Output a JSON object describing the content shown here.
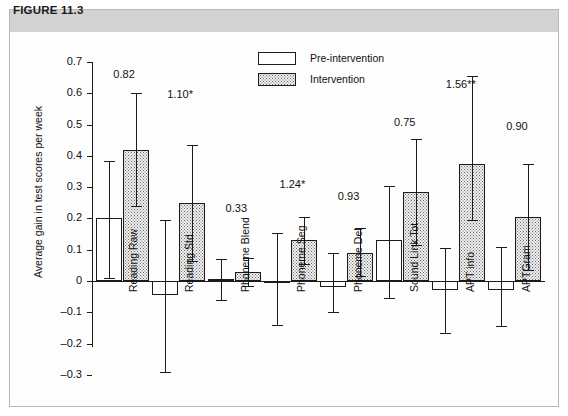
{
  "figure": {
    "header_label": "FIGURE 11.3"
  },
  "legend": {
    "position": "top-center",
    "entries": [
      {
        "label": "Pre-intervention",
        "swatch": "white-box",
        "icon": "legend-swatch-pre-icon"
      },
      {
        "label": "Intervention",
        "swatch": "dotted-box",
        "icon": "legend-swatch-post-icon"
      }
    ]
  },
  "chart_data": {
    "type": "bar",
    "title": "FIGURE 11.3",
    "xlabel": "",
    "ylabel": "Average gain in test scores per week",
    "ylim": [
      -0.3,
      0.7
    ],
    "ytick_labels": [
      "0.7",
      "0.6",
      "0.5",
      "0.4",
      "0.3",
      "0.2",
      "0.1",
      "0",
      "–0.1",
      "–0.2",
      "–0.3"
    ],
    "yticks": [
      0.7,
      0.6,
      0.5,
      0.4,
      0.3,
      0.2,
      0.1,
      0,
      -0.1,
      -0.2,
      -0.3
    ],
    "grid": false,
    "categories": [
      "Reading Raw",
      "Reading Std",
      "Phoneme Blend",
      "Phoneme Seg",
      "Phoneme Del",
      "Sound Link Tot",
      "APT info",
      "APTGram"
    ],
    "series": [
      {
        "name": "Pre-intervention",
        "values": [
          0.2,
          -0.045,
          0.005,
          0.0,
          -0.02,
          0.13,
          -0.03,
          -0.03
        ],
        "err_low": [
          0.01,
          -0.29,
          -0.06,
          -0.14,
          -0.1,
          -0.055,
          -0.165,
          -0.145
        ],
        "err_high": [
          0.385,
          0.195,
          0.07,
          0.155,
          0.09,
          0.305,
          0.105,
          0.11
        ]
      },
      {
        "name": "Intervention",
        "values": [
          0.42,
          0.25,
          0.03,
          0.13,
          0.09,
          0.285,
          0.375,
          0.205
        ],
        "err_low": [
          0.24,
          0.065,
          -0.015,
          0.055,
          0.015,
          0.115,
          0.195,
          0.035
        ],
        "err_high": [
          0.6,
          0.435,
          0.075,
          0.205,
          0.17,
          0.455,
          0.655,
          0.375
        ]
      }
    ],
    "annotations": [
      "0.82",
      "1.10*",
      "0.33",
      "1.24*",
      "0.93",
      "0.75",
      "1.56**",
      "0.90"
    ],
    "annotation_note": "effect size labels above each category group"
  }
}
